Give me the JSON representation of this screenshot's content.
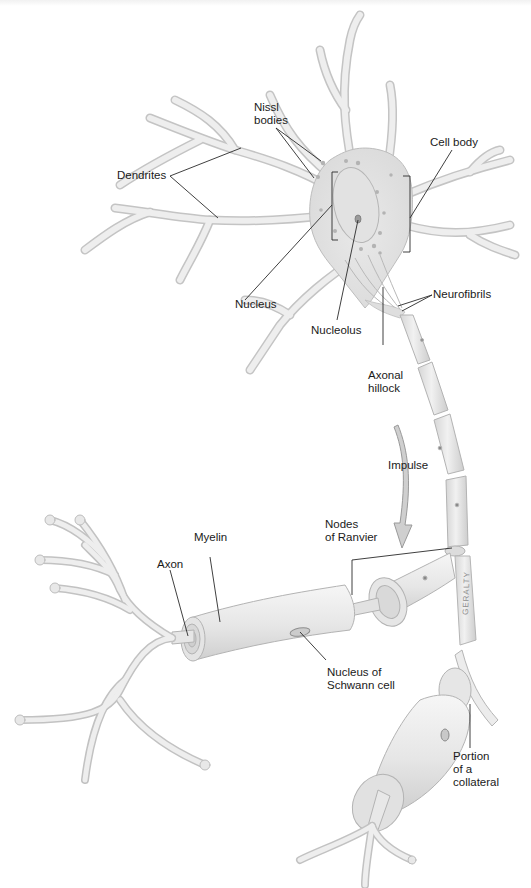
{
  "diagram": {
    "labels": {
      "dendrites": "Dendrites",
      "nissl_bodies": "Nissl\nbodies",
      "cell_body": "Cell body",
      "nucleus": "Nucleus",
      "nucleolus": "Nucleolus",
      "neurofibrils": "Neurofibrils",
      "axonal_hillock": "Axonal\nhillock",
      "impulse": "Impulse",
      "nodes_of_ranvier": "Nodes\nof Ranvier",
      "myelin": "Myelin",
      "axon": "Axon",
      "nucleus_of_schwann_cell": "Nucleus of\nSchwann cell",
      "portion_of_a_collateral": "Portion\nof a\ncollateral"
    },
    "signature": "GERALTY",
    "colors": {
      "tissue_fill": "#ececec",
      "tissue_stroke": "#b9b9b9",
      "leader_line": "#2a2a2a",
      "text": "#1a1a1a",
      "arrow": "#9a9a9a"
    }
  }
}
